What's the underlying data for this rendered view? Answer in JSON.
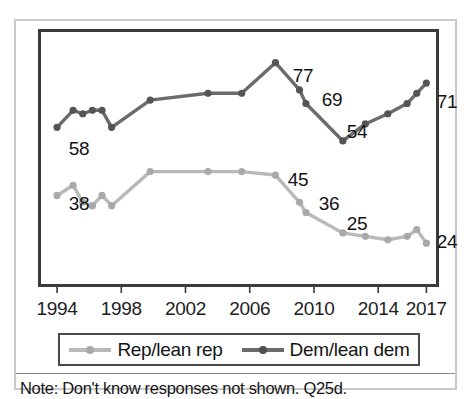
{
  "chart_data": {
    "type": "line",
    "title": "",
    "subtitle": "",
    "xlabel": "",
    "ylabel": "",
    "xlim": [
      1993.0,
      2017.6
    ],
    "ylim": [
      12,
      86
    ],
    "grid": false,
    "legend_position": "bottom",
    "tick_labels": [
      "1994",
      "1998",
      "2002",
      "2006",
      "2010",
      "2014",
      "2017"
    ],
    "tick_values": [
      1994,
      1998,
      2002,
      2006,
      2010,
      2014,
      2017
    ],
    "series": [
      {
        "name": "Rep/lean rep",
        "color": "#b9b9b9",
        "x": [
          1994,
          1995,
          1995.6,
          1996.2,
          1996.8,
          1997.4,
          1999.8,
          2003.4,
          2005.5,
          2007.6,
          2009.1,
          2009.5,
          2011.8,
          2013.2,
          2014.6,
          2015.8,
          2016.4,
          2017
        ],
        "values": [
          38,
          41,
          36,
          35,
          38,
          35,
          45,
          45,
          45,
          44,
          36,
          33,
          27,
          26,
          25,
          26,
          28,
          24
        ]
      },
      {
        "name": "Dem/lean dem",
        "color": "#6b6b6b",
        "x": [
          1994,
          1995,
          1995.6,
          1996.2,
          1996.8,
          1997.4,
          1999.8,
          2003.4,
          2005.5,
          2007.6,
          2009.1,
          2009.5,
          2011.8,
          2013.2,
          2014.6,
          2015.8,
          2016.4,
          2017
        ],
        "values": [
          58,
          63,
          62,
          63,
          63,
          58,
          66,
          68,
          68,
          77,
          69,
          65,
          54,
          59,
          62,
          65,
          68,
          71
        ]
      }
    ],
    "point_labels": [
      {
        "text": "58",
        "series": "Dem/lean dem",
        "anchor_x": 1993.4,
        "anchor_y": 55,
        "px_left": 60,
        "px_top": 125
      },
      {
        "text": "38",
        "series": "Rep/lean rep",
        "anchor_x": 1993.4,
        "anchor_y": 37,
        "px_left": 60,
        "px_top": 180
      },
      {
        "text": "77",
        "series": "Dem/lean dem",
        "anchor_x": 2007.6,
        "anchor_y": 82,
        "px_left": 284,
        "px_top": 52
      },
      {
        "text": "69",
        "series": "Dem/lean dem",
        "anchor_x": 2010.0,
        "anchor_y": 74,
        "px_left": 313,
        "px_top": 76
      },
      {
        "text": "54",
        "series": "Dem/lean dem",
        "anchor_x": 2012.4,
        "anchor_y": 59,
        "px_left": 338,
        "px_top": 108
      },
      {
        "text": "71",
        "series": "Dem/lean dem",
        "anchor_x": 2017.5,
        "anchor_y": 73,
        "px_left": 428,
        "px_top": 78
      },
      {
        "text": "45",
        "series": "Rep/lean rep",
        "anchor_x": 2007.6,
        "anchor_y": 50,
        "px_left": 279,
        "px_top": 156
      },
      {
        "text": "36",
        "series": "Rep/lean rep",
        "anchor_x": 2010.0,
        "anchor_y": 41,
        "px_left": 310,
        "px_top": 180
      },
      {
        "text": "25",
        "series": "Rep/lean rep",
        "anchor_x": 2012.4,
        "anchor_y": 31,
        "px_left": 338,
        "px_top": 200
      },
      {
        "text": "24",
        "series": "Rep/lean rep",
        "anchor_x": 2017.5,
        "anchor_y": 21,
        "px_left": 428,
        "px_top": 218
      }
    ]
  },
  "legend": {
    "items": [
      {
        "label": "Rep/lean rep",
        "color": "#b9b9b9"
      },
      {
        "label": "Dem/lean dem",
        "color": "#6b6b6b"
      }
    ]
  },
  "note": {
    "text": "Note: Don't know responses not shown. Q25d."
  }
}
